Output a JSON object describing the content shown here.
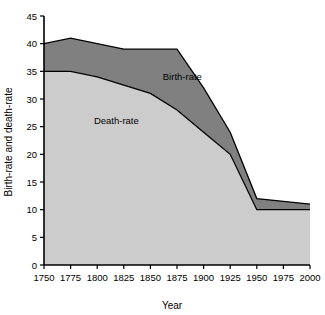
{
  "chart_data": {
    "type": "area",
    "title": "",
    "xlabel": "Year",
    "ylabel": "Birth-rate and death-rate",
    "xlim": [
      1750,
      2000
    ],
    "ylim": [
      0,
      45
    ],
    "grid": false,
    "legend_position": "inline-annotation",
    "x_ticks": [
      1750,
      1775,
      1800,
      1825,
      1850,
      1875,
      1900,
      1925,
      1950,
      1975,
      2000
    ],
    "x_tick_labels": [
      "1750",
      "1775",
      "1800",
      "1825",
      "1850",
      "1875",
      "1900",
      "1925",
      "1950",
      "1975",
      "2000"
    ],
    "y_ticks": [
      0,
      5,
      10,
      15,
      20,
      25,
      30,
      35,
      40,
      45
    ],
    "y_tick_labels": [
      "0",
      "5",
      "10",
      "15",
      "20",
      "25",
      "30",
      "35",
      "40",
      "45"
    ],
    "x": [
      1750,
      1775,
      1800,
      1825,
      1850,
      1875,
      1900,
      1925,
      1950,
      1975,
      2000
    ],
    "series": [
      {
        "name": "Birth-rate",
        "values": [
          40,
          41,
          40,
          39,
          39,
          39,
          32,
          24,
          12,
          11.5,
          11
        ],
        "fill_color": "#808080",
        "line_color": "#000000",
        "annotation": "Birth-rate"
      },
      {
        "name": "Death-rate",
        "values": [
          35,
          35,
          34,
          32.5,
          31,
          28,
          24,
          20,
          10,
          10,
          10
        ],
        "fill_color": "#cccccc",
        "line_color": "#000000",
        "annotation": "Death-rate"
      }
    ],
    "annotations": [
      {
        "label": "Birth-rate",
        "x": 1880,
        "y": 33.5
      },
      {
        "label": "Death-rate",
        "x": 1818,
        "y": 25.5
      }
    ],
    "colors": {
      "birth_band": "#808080",
      "death_band": "#cccccc",
      "axis": "#000000",
      "background": "#ffffff"
    }
  }
}
